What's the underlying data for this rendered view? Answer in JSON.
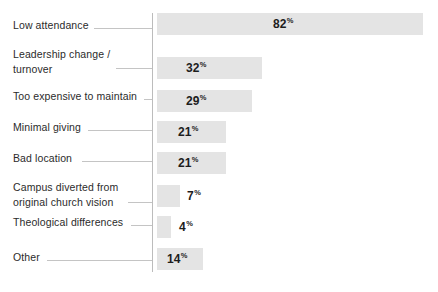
{
  "chart_data": {
    "type": "bar",
    "orientation": "horizontal",
    "title": "",
    "xlabel": "",
    "ylabel": "",
    "xlim": [
      0,
      100
    ],
    "grid": false,
    "legend": false,
    "value_suffix": "%",
    "categories": [
      "Low attendance",
      "Leadership change /\nturnover",
      "Too expensive to maintain",
      "Minimal giving",
      "Bad location",
      "Campus diverted from\noriginal church vision",
      "Theological differences",
      "Other"
    ],
    "values": [
      82,
      32,
      29,
      21,
      21,
      7,
      4,
      14
    ],
    "value_labels": [
      "82",
      "32",
      "29",
      "21",
      "21",
      "7",
      "4",
      "14"
    ],
    "colors": {
      "bar": "#e4e4e4",
      "axis": "#bcbcbc",
      "leader": "#c4c4c4",
      "label_text": "#2b2b2b",
      "value_text": "#1d1d1d",
      "background": "#ffffff"
    }
  },
  "rows": [
    {
      "label": "Low attendance",
      "value_label": "82",
      "pct": "%",
      "label_top": 18,
      "leader_left": 94,
      "leader_width": 58,
      "leader_top": 28,
      "bar_top": 13,
      "bar_left": 157,
      "bar_width": 266,
      "value_left": 273,
      "value_inside": true
    },
    {
      "label": "Leadership change /\nturnover",
      "value_label": "32",
      "pct": "%",
      "label_top": 47,
      "leader_left": 116,
      "leader_width": 36,
      "leader_top": 68,
      "bar_top": 57,
      "bar_left": 157,
      "bar_width": 105,
      "value_left": 186,
      "value_inside": true
    },
    {
      "label": "Too expensive to maintain",
      "value_label": "29",
      "pct": "%",
      "label_top": 89,
      "leader_left": 144,
      "leader_width": 8,
      "leader_top": 99,
      "bar_top": 90,
      "bar_left": 157,
      "bar_width": 95,
      "value_left": 186,
      "value_inside": true
    },
    {
      "label": "Minimal giving",
      "value_label": "21",
      "pct": "%",
      "label_top": 120,
      "leader_left": 88,
      "leader_width": 64,
      "leader_top": 130,
      "bar_top": 121,
      "bar_left": 157,
      "bar_width": 69,
      "value_left": 178,
      "value_inside": true
    },
    {
      "label": "Bad location",
      "value_label": "21",
      "pct": "%",
      "label_top": 151,
      "leader_left": 82,
      "leader_width": 70,
      "leader_top": 161,
      "bar_top": 152,
      "bar_left": 157,
      "bar_width": 69,
      "value_left": 178,
      "value_inside": true
    },
    {
      "label": "Campus diverted from\noriginal church vision",
      "value_label": "7",
      "pct": "%",
      "label_top": 180,
      "leader_left": 128,
      "leader_width": 24,
      "leader_top": 202,
      "bar_top": 185,
      "bar_left": 157,
      "bar_width": 23,
      "value_left": 187,
      "value_inside": false
    },
    {
      "label": "Theological differences",
      "value_label": "4",
      "pct": "%",
      "label_top": 215,
      "leader_left": 131,
      "leader_width": 21,
      "leader_top": 225,
      "bar_top": 216,
      "bar_left": 157,
      "bar_width": 14,
      "value_left": 179,
      "value_inside": false
    },
    {
      "label": "Other",
      "value_label": "14",
      "pct": "%",
      "label_top": 250,
      "leader_left": 47,
      "leader_width": 105,
      "leader_top": 260,
      "bar_top": 248,
      "bar_left": 157,
      "bar_width": 46,
      "value_left": 167,
      "value_inside": true
    }
  ],
  "caption": ""
}
